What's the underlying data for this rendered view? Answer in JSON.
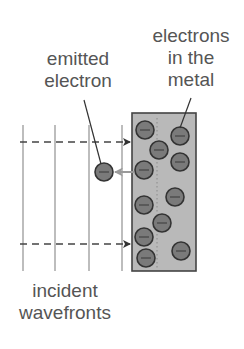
{
  "labels": {
    "emitted_electron": [
      "emitted",
      "electron"
    ],
    "electrons_in_metal": [
      "electrons",
      "in the",
      "metal"
    ],
    "incident_wavefronts": [
      "incident",
      "wavefronts"
    ]
  },
  "colors": {
    "text": "#555555",
    "metal_fill": "#b9b9b9",
    "metal_stroke": "#444444",
    "electron_fill": "#7a7a7a",
    "electron_stroke": "#333333",
    "wavefront_line": "#9a9a9a",
    "dashed_arrow": "#444444",
    "emission_arrow": "#9a9a9a",
    "leader_line": "#333333"
  },
  "diagram": {
    "metal_block": {
      "x": 132,
      "y": 113,
      "width": 64,
      "height": 158
    },
    "wavefronts_x": [
      23,
      55,
      89,
      122
    ],
    "wavefront_y_range": [
      125,
      271
    ],
    "incident_rays_y": [
      142,
      244
    ],
    "emitted_electron": {
      "cx": 104,
      "cy": 172,
      "r": 9
    },
    "metal_electrons": [
      {
        "cx": 145,
        "cy": 130
      },
      {
        "cx": 180,
        "cy": 136
      },
      {
        "cx": 159,
        "cy": 150
      },
      {
        "cx": 180,
        "cy": 162
      },
      {
        "cx": 144,
        "cy": 170
      },
      {
        "cx": 175,
        "cy": 197
      },
      {
        "cx": 144,
        "cy": 205
      },
      {
        "cx": 162,
        "cy": 223
      },
      {
        "cx": 144,
        "cy": 237
      },
      {
        "cx": 181,
        "cy": 251
      },
      {
        "cx": 146,
        "cy": 258
      }
    ]
  }
}
